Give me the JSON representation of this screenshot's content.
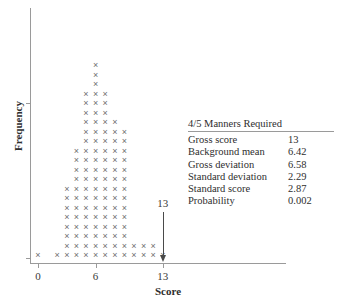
{
  "chart_data": {
    "type": "bar",
    "title": "",
    "xlabel": "Score",
    "ylabel": "Frequency",
    "xlim": [
      -1,
      18
    ],
    "xticks": [
      0,
      6,
      13
    ],
    "xtick_labels": [
      "0",
      "6",
      "13"
    ],
    "grid": false,
    "legend": null,
    "note": "Dot plot / stacked-X histogram: each X glyph is one observation at the given integer score.",
    "categories": [
      0,
      1,
      2,
      3,
      4,
      5,
      6,
      7,
      8,
      9,
      10,
      11,
      12,
      13
    ],
    "values": [
      1,
      0,
      1,
      8,
      12,
      18,
      21,
      18,
      15,
      14,
      2,
      2,
      2,
      1
    ],
    "annotations": [
      {
        "label": "13",
        "x": 13,
        "type": "down-arrow",
        "description": "Arrow marking the observed gross score of 13 on the Score axis"
      }
    ]
  },
  "axes": {
    "y_label": "Frequency",
    "x_label": "Score",
    "x_ticks": [
      {
        "value": 0,
        "label": "0"
      },
      {
        "value": 6,
        "label": "6"
      },
      {
        "value": 13,
        "label": "13"
      }
    ]
  },
  "stats_panel": {
    "title": "4/5 Manners Required",
    "rows": [
      {
        "label": "Gross score",
        "value": "13"
      },
      {
        "label": "Background mean",
        "value": "6.42"
      },
      {
        "label": "Gross deviation",
        "value": "6.58"
      },
      {
        "label": "Standard deviation",
        "value": "2.29"
      },
      {
        "label": "Standard score",
        "value": "2.87"
      },
      {
        "label": "Probability",
        "value": "0.002"
      }
    ]
  },
  "colors": {
    "mark": "#6e6e6e",
    "axis": "#9a9a9a",
    "text": "#2e2e2e",
    "annotation": "#4a4a4a",
    "background": "#ffffff"
  }
}
